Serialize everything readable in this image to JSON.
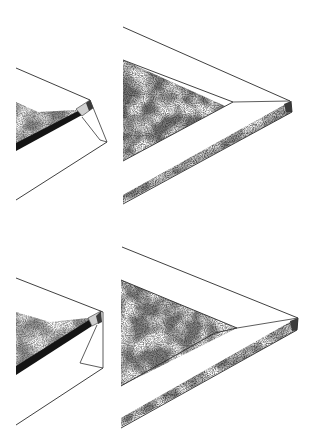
{
  "figure": {
    "layout": "2x2 grid",
    "background_color": "#ffffff",
    "ink_color": "#2a2a2a",
    "stipple_dark": "#1a1a1a",
    "stipple_light": "#9a9a9a",
    "panels": [
      {
        "id": "top-left",
        "shape": "truncated wedge with side facet and dark edge band"
      },
      {
        "id": "top-right",
        "shape": "pointed wedge with stippled triangle and beveled lower bar"
      },
      {
        "id": "bottom-left",
        "shape": "truncated wedge with side facet and dark edge band"
      },
      {
        "id": "bottom-right",
        "shape": "pointed wedge with stippled triangle and beveled lower bar"
      }
    ]
  }
}
